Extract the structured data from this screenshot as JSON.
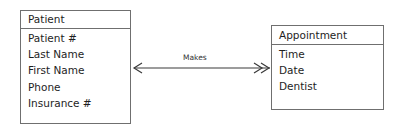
{
  "entities": {
    "patient": {
      "title": "Patient",
      "attributes": [
        "Patient #",
        "Last Name",
        "First Name",
        "Phone",
        "Insurance #"
      ]
    },
    "appointment": {
      "title": "Appointment",
      "attributes": [
        "Time",
        "Date",
        "Dentist"
      ]
    }
  },
  "relationship": {
    "label": "Makes",
    "from": "Patient",
    "to": "Appointment",
    "from_end": "single-arrow",
    "to_end": "double-arrow"
  },
  "colors": {
    "border": "#6f6f6f",
    "text": "#1e1e1e",
    "background": "#ffffff"
  }
}
